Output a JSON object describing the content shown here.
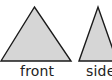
{
  "diagram": {
    "shapes": [
      {
        "name": "front-view-triangle",
        "fill": "#d6d6d6",
        "stroke": "#1a1a1a",
        "label": "front"
      },
      {
        "name": "side-view-triangle",
        "fill": "#d6d6d6",
        "stroke": "#1a1a1a",
        "label": "side"
      }
    ]
  }
}
